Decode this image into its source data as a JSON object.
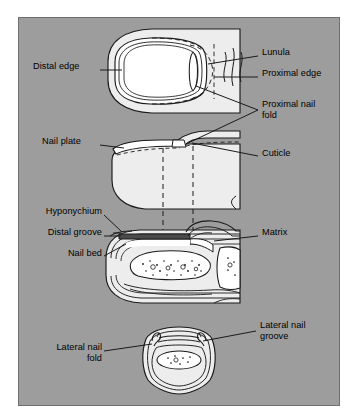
{
  "figure": {
    "kind": "anatomical-diagram",
    "panel_background_color": "#9d9d9d",
    "panel_border_color": "#6f6f6f",
    "outer_background_color": "#ffffff",
    "ink_color": "#000000",
    "tissue_fill_color": "#ededed",
    "nail_plate_fill_color": "#ffffff"
  },
  "views": [
    {
      "id": "dorsal-view",
      "name": "Dorsal view of fingertip and nail plate"
    },
    {
      "id": "lateral-view",
      "name": "Lateral profile view of fingertip"
    },
    {
      "id": "sagittal-section",
      "name": "Sagittal cross-section of fingertip"
    },
    {
      "id": "transverse-section",
      "name": "Transverse cross-section of fingertip"
    }
  ],
  "labels": [
    {
      "id": "distal-edge",
      "text": "Distal edge",
      "lines": [
        "Distal edge"
      ],
      "align": "left",
      "x": 33,
      "y": 66,
      "width": 76
    },
    {
      "id": "lunula",
      "text": "Lunula",
      "lines": [
        "Lunula"
      ],
      "align": "left",
      "x": 262,
      "y": 52,
      "width": 86
    },
    {
      "id": "proximal-edge",
      "text": "Proximal edge",
      "lines": [
        "Proximal edge"
      ],
      "align": "left",
      "x": 262,
      "y": 73,
      "width": 90
    },
    {
      "id": "proximal-nail-fold",
      "text": "Proximal nail fold",
      "lines": [
        "Proximal nail",
        "fold"
      ],
      "align": "left",
      "x": 262,
      "y": 103,
      "width": 90
    },
    {
      "id": "nail-plate",
      "text": "Nail plate",
      "lines": [
        "Nail plate"
      ],
      "align": "left",
      "x": 42,
      "y": 141,
      "width": 68
    },
    {
      "id": "cuticle",
      "text": "Cuticle",
      "lines": [
        "Cuticle"
      ],
      "align": "left",
      "x": 262,
      "y": 152,
      "width": 86
    },
    {
      "id": "hyponychium",
      "text": "Hyponychium",
      "lines": [
        "Hyponychium"
      ],
      "align": "right",
      "x": 12,
      "y": 211,
      "width": 90
    },
    {
      "id": "distal-groove",
      "text": "Distal groove",
      "lines": [
        "Distal groove"
      ],
      "align": "right",
      "x": 12,
      "y": 231,
      "width": 90
    },
    {
      "id": "matrix",
      "text": "Matrix",
      "lines": [
        "Matrix"
      ],
      "align": "left",
      "x": 262,
      "y": 231,
      "width": 80
    },
    {
      "id": "nail-bed",
      "text": "Nail bed",
      "lines": [
        "Nail bed"
      ],
      "align": "right",
      "x": 12,
      "y": 252,
      "width": 90
    },
    {
      "id": "lateral-nail-groove",
      "text": "Lateral nail groove",
      "lines": [
        "Lateral nail",
        "groove"
      ],
      "align": "left",
      "x": 260,
      "y": 324,
      "width": 92
    },
    {
      "id": "lateral-nail-fold",
      "text": "Lateral nail fold",
      "lines": [
        "Lateral nail",
        "fold"
      ],
      "align": "right",
      "x": 10,
      "y": 346,
      "width": 92
    }
  ]
}
